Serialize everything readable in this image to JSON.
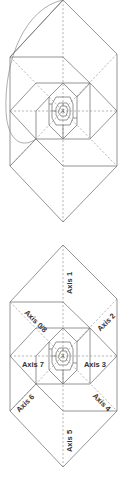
{
  "figure": {
    "colors": {
      "line": "#7a7a7a",
      "dashed_axis": "#9a9a9a",
      "label_text": "#333333",
      "background": "#ffffff"
    },
    "top_diagram": {
      "name": "Spiral construction with arc",
      "center_mark": "A"
    },
    "bottom_diagram": {
      "name": "Spiral construction with axes",
      "center_mark": "A",
      "axes": [
        {
          "id": "axis-0-8",
          "label": "Axis 0/8"
        },
        {
          "id": "axis-1",
          "label": "Axis 1"
        },
        {
          "id": "axis-2",
          "label": "Axis 2"
        },
        {
          "id": "axis-3",
          "label": "Axis 3"
        },
        {
          "id": "axis-4",
          "label": "Axis 4"
        },
        {
          "id": "axis-5",
          "label": "Axis 5"
        },
        {
          "id": "axis-6",
          "label": "Axis 6"
        },
        {
          "id": "axis-7",
          "label": "Axis 7"
        }
      ]
    }
  }
}
